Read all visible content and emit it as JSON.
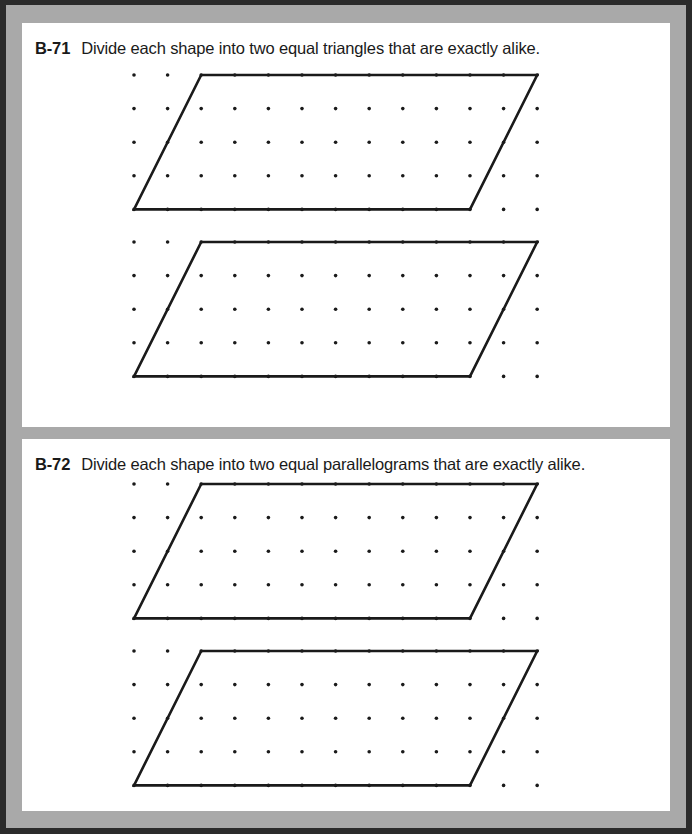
{
  "page": {
    "background_color": "#ffffff",
    "frame_color": "#2b2b2b",
    "mat_color": "#a9a9a9",
    "panel_color": "#ffffff",
    "ink_color": "#1a1a1a"
  },
  "exercises": [
    {
      "code": "B-71",
      "text": "Divide each shape into two equal triangles that are exactly alike.",
      "figures": [
        {
          "name": "parallelogram-1",
          "grid": {
            "cols": 13,
            "rows": 5,
            "spacing": 33.6,
            "dot_radius": 1.8,
            "dot_color": "#1a1a1a"
          },
          "shape": {
            "type": "parallelogram",
            "stroke_color": "#1a1a1a",
            "stroke_width": 2.6,
            "vertices_grid": [
              [
                0,
                4
              ],
              [
                10,
                4
              ],
              [
                12,
                0
              ],
              [
                2,
                0
              ]
            ]
          }
        },
        {
          "name": "parallelogram-2",
          "grid": {
            "cols": 13,
            "rows": 5,
            "spacing": 33.6,
            "dot_radius": 1.8,
            "dot_color": "#1a1a1a"
          },
          "shape": {
            "type": "parallelogram",
            "stroke_color": "#1a1a1a",
            "stroke_width": 2.6,
            "vertices_grid": [
              [
                0,
                4
              ],
              [
                10,
                4
              ],
              [
                12,
                0
              ],
              [
                2,
                0
              ]
            ]
          }
        }
      ]
    },
    {
      "code": "B-72",
      "text": "Divide each shape into two equal parallelograms that are exactly alike.",
      "figures": [
        {
          "name": "parallelogram-1",
          "grid": {
            "cols": 13,
            "rows": 5,
            "spacing": 33.6,
            "dot_radius": 1.8,
            "dot_color": "#1a1a1a"
          },
          "shape": {
            "type": "parallelogram",
            "stroke_color": "#1a1a1a",
            "stroke_width": 2.6,
            "vertices_grid": [
              [
                0,
                4
              ],
              [
                10,
                4
              ],
              [
                12,
                0
              ],
              [
                2,
                0
              ]
            ]
          }
        },
        {
          "name": "parallelogram-2",
          "grid": {
            "cols": 13,
            "rows": 5,
            "spacing": 33.6,
            "dot_radius": 1.8,
            "dot_color": "#1a1a1a"
          },
          "shape": {
            "type": "parallelogram",
            "stroke_color": "#1a1a1a",
            "stroke_width": 2.6,
            "vertices_grid": [
              [
                0,
                4
              ],
              [
                10,
                4
              ],
              [
                12,
                0
              ],
              [
                2,
                0
              ]
            ]
          }
        }
      ]
    }
  ]
}
